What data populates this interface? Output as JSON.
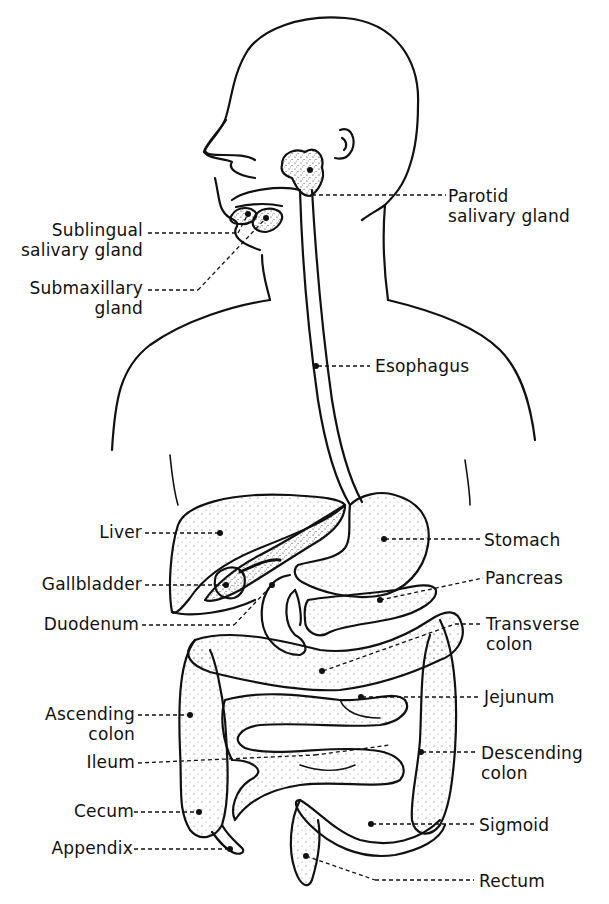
{
  "diagram": {
    "style": "black-and-white stippled line illustration",
    "colors": {
      "ink": "#111111",
      "background": "#ffffff"
    },
    "labels_left": [
      {
        "id": "sublingual",
        "line1": "Sublingual",
        "line2": "salivary gland"
      },
      {
        "id": "submaxillary",
        "line1": "Submaxillary",
        "line2": "gland"
      },
      {
        "id": "liver",
        "line1": "Liver"
      },
      {
        "id": "gallbladder",
        "line1": "Gallbladder"
      },
      {
        "id": "duodenum",
        "line1": "Duodenum"
      },
      {
        "id": "ascending",
        "line1": "Ascending",
        "line2": "colon"
      },
      {
        "id": "ileum",
        "line1": "Ileum"
      },
      {
        "id": "cecum",
        "line1": "Cecum"
      },
      {
        "id": "appendix",
        "line1": "Appendix"
      }
    ],
    "labels_right": [
      {
        "id": "parotid",
        "line1": "Parotid",
        "line2": "salivary gland"
      },
      {
        "id": "esophagus",
        "line1": "Esophagus"
      },
      {
        "id": "stomach",
        "line1": "Stomach"
      },
      {
        "id": "pancreas",
        "line1": "Pancreas"
      },
      {
        "id": "transverse",
        "line1": "Transverse",
        "line2": "colon"
      },
      {
        "id": "jejunum",
        "line1": "Jejunum"
      },
      {
        "id": "descending",
        "line1": "Descending",
        "line2": "colon"
      },
      {
        "id": "sigmoid",
        "line1": "Sigmoid"
      },
      {
        "id": "rectum",
        "line1": "Rectum"
      }
    ]
  }
}
